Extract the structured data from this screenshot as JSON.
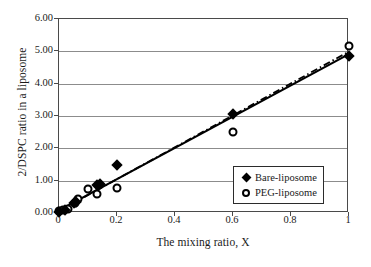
{
  "chart_data": {
    "type": "scatter",
    "title": "",
    "xlabel": "The mixing ratio, X",
    "ylabel": "2/DSPC ratio in a liposome",
    "xlim": [
      0,
      1
    ],
    "ylim": [
      0,
      6
    ],
    "xticks": [
      "0",
      "0.2",
      "0.4",
      "0.6",
      "0.8",
      "1"
    ],
    "xtick_values": [
      0,
      0.2,
      0.4,
      0.6,
      0.8,
      1
    ],
    "yticks": [
      "0.00",
      "1.00",
      "2.00",
      "3.00",
      "4.00",
      "5.00",
      "6.00"
    ],
    "ytick_values": [
      0,
      1,
      2,
      3,
      4,
      5,
      6
    ],
    "grid": "horizontal",
    "legend_position": "lower-right",
    "series": [
      {
        "name": "Bare-liposome",
        "marker": "filled-diamond",
        "color": "#000000",
        "points": [
          {
            "x": 0.0,
            "y": 0.02
          },
          {
            "x": 0.02,
            "y": 0.1
          },
          {
            "x": 0.05,
            "y": 0.3
          },
          {
            "x": 0.06,
            "y": 0.35
          },
          {
            "x": 0.13,
            "y": 0.88
          },
          {
            "x": 0.14,
            "y": 0.9
          },
          {
            "x": 0.2,
            "y": 1.5
          },
          {
            "x": 0.6,
            "y": 3.05
          },
          {
            "x": 1.0,
            "y": 4.85
          }
        ],
        "fit_line": {
          "style": "solid",
          "x0": 0.0,
          "y0": 0.02,
          "x1": 1.0,
          "y1": 4.87
        }
      },
      {
        "name": "PEG-liposome",
        "marker": "open-circle",
        "color": "#000000",
        "points": [
          {
            "x": 0.0,
            "y": 0.05
          },
          {
            "x": 0.015,
            "y": 0.08
          },
          {
            "x": 0.03,
            "y": 0.12
          },
          {
            "x": 0.055,
            "y": 0.3
          },
          {
            "x": 0.065,
            "y": 0.42
          },
          {
            "x": 0.1,
            "y": 0.75
          },
          {
            "x": 0.13,
            "y": 0.6
          },
          {
            "x": 0.2,
            "y": 0.78
          },
          {
            "x": 0.6,
            "y": 2.5
          },
          {
            "x": 1.0,
            "y": 5.15
          }
        ],
        "fit_line": {
          "style": "dash-dot",
          "x0": 0.0,
          "y0": 0.0,
          "x1": 1.0,
          "y1": 4.95
        }
      }
    ]
  },
  "legend": {
    "items": [
      {
        "label": "Bare-liposome",
        "marker": "filled-diamond"
      },
      {
        "label": "PEG-liposome",
        "marker": "open-circle"
      }
    ]
  }
}
